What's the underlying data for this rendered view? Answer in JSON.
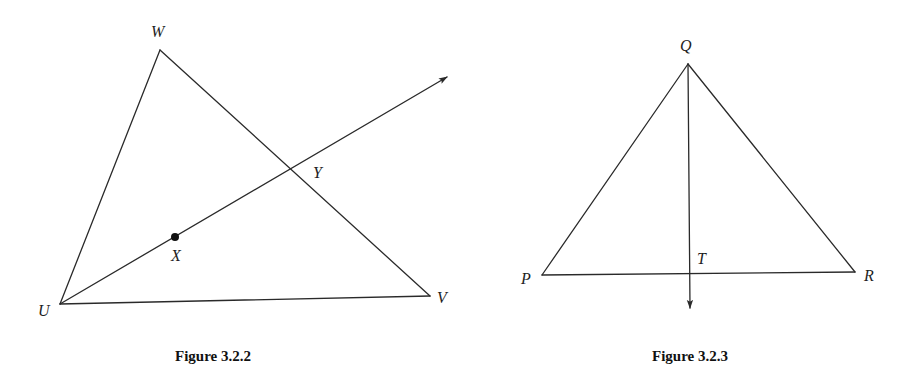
{
  "figures": [
    {
      "id": "fig-3-2-2",
      "caption": "Figure 3.2.2",
      "points": {
        "W": {
          "label": "W",
          "x": 160,
          "y": 50
        },
        "U": {
          "label": "U",
          "x": 60,
          "y": 304
        },
        "V": {
          "label": "V",
          "x": 430,
          "y": 296
        },
        "X": {
          "label": "X",
          "x": 175,
          "y": 237
        },
        "Y": {
          "label": "Y",
          "x": 292,
          "y": 169
        }
      },
      "segments": [
        [
          "U",
          "W"
        ],
        [
          "W",
          "V"
        ],
        [
          "U",
          "V"
        ]
      ],
      "rays": [
        {
          "from": "U",
          "through": "X",
          "tip": [
            447,
            77
          ]
        }
      ],
      "marked_points": [
        "X"
      ]
    },
    {
      "id": "fig-3-2-3",
      "caption": "Figure 3.2.3",
      "points": {
        "Q": {
          "label": "Q",
          "x": 688,
          "y": 64
        },
        "P": {
          "label": "P",
          "x": 542,
          "y": 275
        },
        "R": {
          "label": "R",
          "x": 855,
          "y": 272
        },
        "T": {
          "label": "T",
          "x": 689,
          "y": 274
        }
      },
      "segments": [
        [
          "P",
          "Q"
        ],
        [
          "Q",
          "R"
        ],
        [
          "P",
          "R"
        ]
      ],
      "rays": [
        {
          "from": "Q",
          "through": "T",
          "tip": [
            690,
            308
          ]
        }
      ],
      "marked_points": []
    }
  ],
  "colors": {
    "stroke": "#2a2a2a",
    "text": "#1e1e1e",
    "background": "#ffffff"
  }
}
